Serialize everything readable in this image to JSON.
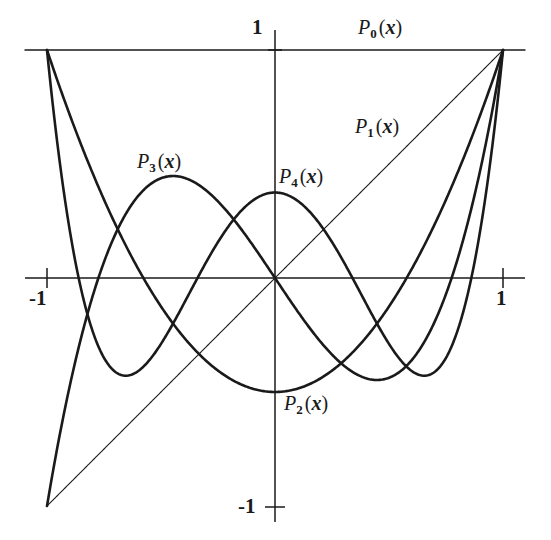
{
  "figure": {
    "title": "",
    "background_color": "#ffffff",
    "ink_color": "#1a1a1a"
  },
  "labels": {
    "P0": {
      "base": "P",
      "sub": "0",
      "arg": "(x)"
    },
    "P1": {
      "base": "P",
      "sub": "1",
      "arg": "(x)"
    },
    "P2": {
      "base": "P",
      "sub": "2",
      "arg": "(x)"
    },
    "P3": {
      "base": "P",
      "sub": "3",
      "arg": "(x)"
    },
    "P4": {
      "base": "P",
      "sub": "4",
      "arg": "(x)"
    }
  },
  "ticks": {
    "y_top": "1",
    "y_bottom": "-1",
    "x_left": "-1",
    "x_right": "1"
  },
  "chart_data": {
    "type": "line",
    "title": "",
    "xlabel": "",
    "ylabel": "",
    "xlim": [
      -1,
      1
    ],
    "ylim": [
      -1,
      1
    ],
    "xticks": [
      -1,
      1
    ],
    "yticks": [
      -1,
      1
    ],
    "xticklabels": [
      "-1",
      "1"
    ],
    "yticklabels": [
      "-1",
      "1"
    ],
    "grid": false,
    "legend": "inline-curve-labels",
    "axes": {
      "x_axis_at_y": 0,
      "y_axis_at_x": 0,
      "spines": "cross-hair"
    },
    "x": [
      -1,
      -0.9,
      -0.8,
      -0.7,
      -0.6,
      -0.5,
      -0.4,
      -0.3,
      -0.2,
      -0.1,
      0,
      0.1,
      0.2,
      0.3,
      0.4,
      0.5,
      0.6,
      0.7,
      0.8,
      0.9,
      1
    ],
    "series": [
      {
        "name": "P0(x)",
        "expression": "1",
        "linewidth": 1.4,
        "values": [
          1,
          1,
          1,
          1,
          1,
          1,
          1,
          1,
          1,
          1,
          1,
          1,
          1,
          1,
          1,
          1,
          1,
          1,
          1,
          1,
          1
        ]
      },
      {
        "name": "P1(x)",
        "expression": "x",
        "linewidth": 1.1,
        "values": [
          -1,
          -0.9,
          -0.8,
          -0.7,
          -0.6,
          -0.5,
          -0.4,
          -0.3,
          -0.2,
          -0.1,
          0,
          0.1,
          0.2,
          0.3,
          0.4,
          0.5,
          0.6,
          0.7,
          0.8,
          0.9,
          1
        ]
      },
      {
        "name": "P2(x)",
        "expression": "(3x^2 - 1)/2",
        "linewidth": 2.6,
        "values": [
          1,
          0.715,
          0.46,
          0.235,
          0.04,
          -0.125,
          -0.26,
          -0.365,
          -0.44,
          -0.485,
          -0.5,
          -0.485,
          -0.44,
          -0.365,
          -0.26,
          -0.125,
          0.04,
          0.235,
          0.46,
          0.715,
          1
        ]
      },
      {
        "name": "P3(x)",
        "expression": "(5x^3 - 3x)/2",
        "linewidth": 2.6,
        "values": [
          -1,
          -0.4725,
          -0.08,
          0.1925,
          0.36,
          0.4375,
          0.44,
          0.3825,
          0.28,
          0.1475,
          0,
          -0.1475,
          -0.28,
          -0.3825,
          -0.44,
          -0.4375,
          -0.36,
          -0.1925,
          0.08,
          0.4725,
          1
        ]
      },
      {
        "name": "P4(x)",
        "expression": "(35x^4 - 30x^2 + 3)/8",
        "linewidth": 2.6,
        "values": [
          1,
          0.0411,
          -0.233,
          -0.313,
          -0.232,
          -0.2891,
          -0.113,
          0.0729,
          0.232,
          0.3379,
          0.375,
          0.3379,
          0.232,
          0.0729,
          -0.113,
          -0.2891,
          -0.232,
          -0.313,
          -0.233,
          0.0411,
          1
        ]
      }
    ],
    "key_points": {
      "P3_left_max": {
        "x": -0.447,
        "y": 0.4472
      },
      "P3_right_min": {
        "x": 0.447,
        "y": -0.4472
      },
      "P4_center_max": {
        "x": 0,
        "y": 0.375
      },
      "P4_side_min": {
        "x": 0.6547,
        "y": -0.4286
      },
      "P2_min": {
        "x": 0,
        "y": -0.5
      }
    }
  }
}
